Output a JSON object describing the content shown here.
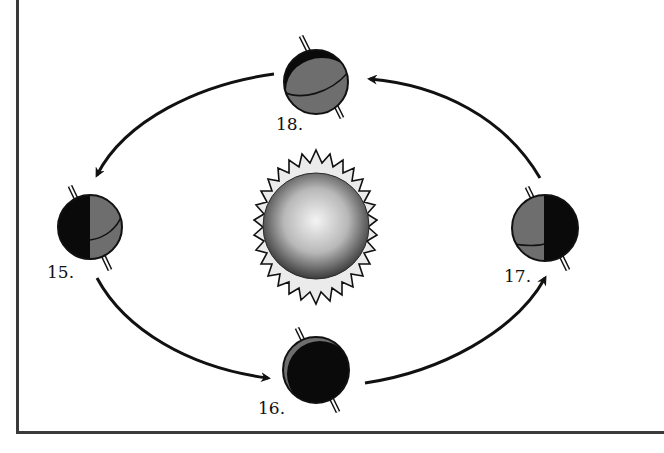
{
  "diagram": {
    "title": "",
    "center": {
      "name": "Sun",
      "icon": "sun-icon"
    },
    "positions": [
      {
        "id": "15",
        "label": "15.",
        "location": "left",
        "shading": "left half dark, right half gray"
      },
      {
        "id": "16",
        "label": "16.",
        "location": "bottom",
        "shading": "mostly dark"
      },
      {
        "id": "17",
        "label": "17.",
        "location": "right",
        "shading": "left half gray, right half dark"
      },
      {
        "id": "18",
        "label": "18.",
        "location": "top",
        "shading": "mostly gray, dark crescent at upper left"
      }
    ],
    "arrows": [
      {
        "from": "18",
        "to": "15"
      },
      {
        "from": "15",
        "to": "16"
      },
      {
        "from": "16",
        "to": "17"
      },
      {
        "from": "17",
        "to": "18"
      }
    ],
    "colors": {
      "dark": "#0a0a0a",
      "gray": "#6e6e6e",
      "frame": "#3a3a3a",
      "sun_halo": "#ebebeb"
    }
  }
}
